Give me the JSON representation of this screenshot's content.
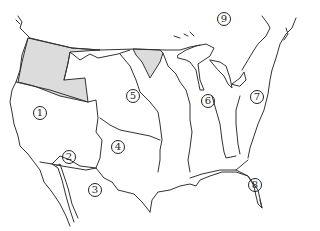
{
  "map": {
    "type": "outline map of territorial regions",
    "colors": {
      "line": "#333333",
      "shaded_region": "#dcdcdc",
      "background": "#ffffff"
    },
    "shaded_regions": [
      "pacific-northwest-region",
      "red-river-basin-region"
    ],
    "labels": [
      {
        "id": "1",
        "text": "1",
        "x": 40,
        "y": 113
      },
      {
        "id": "2",
        "text": "2",
        "x": 69,
        "y": 157
      },
      {
        "id": "3",
        "text": "3",
        "x": 95,
        "y": 190
      },
      {
        "id": "4",
        "text": "4",
        "x": 118,
        "y": 147
      },
      {
        "id": "5",
        "text": "5",
        "x": 133,
        "y": 96
      },
      {
        "id": "6",
        "text": "6",
        "x": 208,
        "y": 101
      },
      {
        "id": "7",
        "text": "7",
        "x": 257,
        "y": 97
      },
      {
        "id": "8",
        "text": "8",
        "x": 255,
        "y": 185
      },
      {
        "id": "9",
        "text": "9",
        "x": 224,
        "y": 19
      }
    ]
  }
}
